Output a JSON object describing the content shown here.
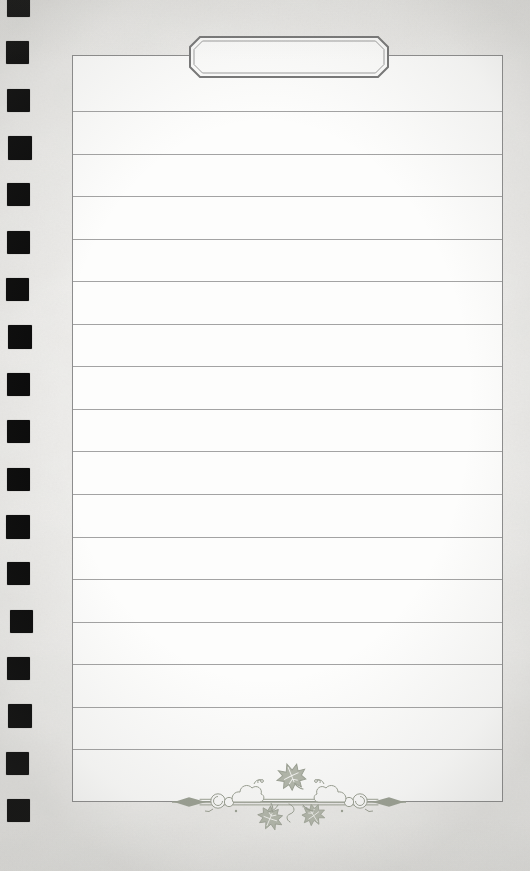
{
  "document": {
    "title_tab": {
      "text": ""
    },
    "ruling": {
      "line_count": 16,
      "line_color": "#9e9e9e",
      "spacing_px": 42.55,
      "first_line_top_px": 55
    },
    "paper": {
      "fill": "#fdfdfc",
      "border_color": "#8d8d8d"
    },
    "background": {
      "base_color": "#efeeec"
    },
    "binding": {
      "hole_count": 18,
      "hole_color": "#0a0a0a",
      "pitch_px": 47.35,
      "start_top_px": -6
    },
    "ornament": {
      "label": "vine-leaf-flourish",
      "stroke_color": "#9ba093",
      "leaf_fill": "#b3b7ab"
    },
    "tab_frame": {
      "outer_border_color": "#787878",
      "inner_border_color": "#9d9d9d"
    }
  }
}
